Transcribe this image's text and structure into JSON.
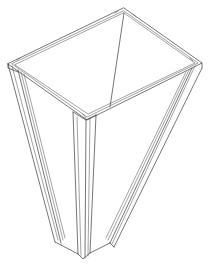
{
  "illustration": {
    "subject": "tapered square planter box line drawing",
    "stroke_color": "#3a3a3a",
    "background": "#ffffff"
  }
}
